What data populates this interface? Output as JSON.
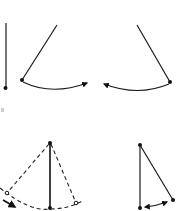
{
  "figure": {
    "title": "Pendulum swing phases",
    "panels": [
      {
        "id": "rest",
        "description": "Pendulum hanging vertically at rest"
      },
      {
        "id": "swing-right",
        "description": "Pendulum displaced left, swinging right along arc"
      },
      {
        "id": "swing-left",
        "description": "Pendulum displaced right, swinging left along arc"
      },
      {
        "id": "amplitude",
        "description": "Vertical pendulum with dashed extreme positions and dashed arc path"
      },
      {
        "id": "small-displacement",
        "description": "Pendulum with small displacement and double-headed arrow along arc"
      }
    ]
  },
  "colors": {
    "line": "#1a1a1a",
    "background": "#ffffff"
  }
}
